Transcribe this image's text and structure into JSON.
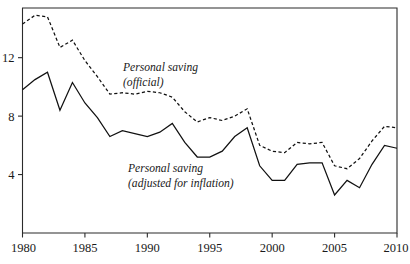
{
  "chart_data": {
    "type": "line",
    "title": "",
    "subtitle": "",
    "xlabel": "",
    "ylabel": "",
    "xlim": [
      1980,
      2010
    ],
    "ylim": [
      0,
      15.4
    ],
    "grid": false,
    "legend_position": "inline-annotations",
    "x_ticks": [
      "1980",
      "1985",
      "1990",
      "1995",
      "2000",
      "2005",
      "2010"
    ],
    "x_tick_values": [
      1980,
      1985,
      1990,
      1995,
      2000,
      2005,
      2010
    ],
    "y_ticks": [
      "4",
      "8",
      "12"
    ],
    "y_tick_values": [
      4,
      8,
      12
    ],
    "x": [
      1980,
      1981,
      1982,
      1983,
      1984,
      1985,
      1986,
      1987,
      1988,
      1989,
      1990,
      1991,
      1992,
      1993,
      1994,
      1995,
      1996,
      1997,
      1998,
      1999,
      2000,
      2001,
      2002,
      2003,
      2004,
      2005,
      2006,
      2007,
      2008,
      2009,
      2010
    ],
    "series": [
      {
        "name": "Personal saving (official)",
        "style": "dashed",
        "label_line1": "Personal saving",
        "label_line2": "(official)",
        "values": [
          14.3,
          14.9,
          14.8,
          12.7,
          13.2,
          11.8,
          10.7,
          9.5,
          9.6,
          9.5,
          9.7,
          9.6,
          9.3,
          8.3,
          7.6,
          7.9,
          7.7,
          8.0,
          8.5,
          6.0,
          5.6,
          5.5,
          6.2,
          6.1,
          6.2,
          4.6,
          4.4,
          5.1,
          6.3,
          7.3,
          7.2
        ]
      },
      {
        "name": "Personal saving (adjusted for inflation)",
        "style": "solid",
        "label_line1": "Personal saving",
        "label_line2": "(adjusted for inflation)",
        "values": [
          9.8,
          10.5,
          11.0,
          8.4,
          10.3,
          8.9,
          7.9,
          6.6,
          7.0,
          6.8,
          6.6,
          6.9,
          7.5,
          6.2,
          5.2,
          5.2,
          5.6,
          6.6,
          7.2,
          4.6,
          3.6,
          3.6,
          4.7,
          4.8,
          4.8,
          2.6,
          3.6,
          3.1,
          4.7,
          6.0,
          5.8
        ]
      }
    ],
    "annotations": [
      {
        "id": "official-label",
        "line1": "Personal saving",
        "line2": "(official)",
        "x_px": 123,
        "y_px": 71
      },
      {
        "id": "adjusted-label",
        "line1": "Personal saving",
        "line2": "(adjusted for inflation)",
        "x_px": 128,
        "y_px": 172
      }
    ]
  },
  "colors": {
    "line": "#111111",
    "axis": "#2b2b2b",
    "background": "#ffffff"
  }
}
